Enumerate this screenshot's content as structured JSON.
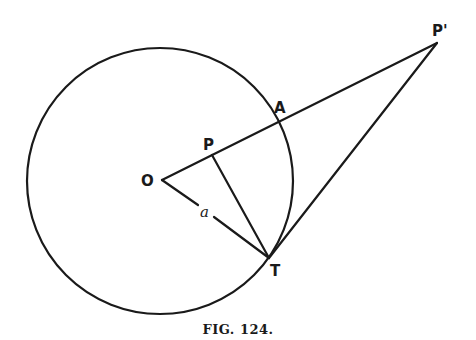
{
  "figure": {
    "caption": "FIG. 124.",
    "circle": {
      "cx": 160,
      "cy": 181,
      "r": 133
    },
    "points": {
      "O": {
        "label": "O",
        "x": 162,
        "y": 180
      },
      "P": {
        "label": "P",
        "x": 212,
        "y": 154
      },
      "A": {
        "label": "A",
        "x": 279,
        "y": 123
      },
      "P_prime": {
        "label": "P'",
        "x": 437,
        "y": 43
      },
      "T": {
        "label": "T",
        "x": 269,
        "y": 258
      }
    },
    "segment_labels": {
      "OT": "a"
    },
    "segments": [
      {
        "name": "O-P'",
        "from": "O",
        "to": "P_prime"
      },
      {
        "name": "O-T",
        "from": "O",
        "to": "T"
      },
      {
        "name": "P-T",
        "from": "P",
        "to": "T"
      },
      {
        "name": "P'-T",
        "from": "P_prime",
        "to": "T"
      }
    ]
  }
}
